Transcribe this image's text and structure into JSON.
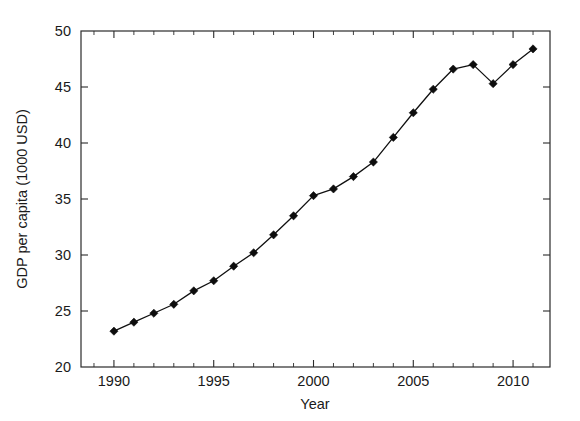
{
  "chart_data": {
    "type": "line",
    "title": "",
    "xlabel": "Year",
    "ylabel": "GDP per capita (1000 USD)",
    "xlim": [
      1988.35,
      2011.85
    ],
    "ylim": [
      20,
      50
    ],
    "xticks": [
      1990,
      1995,
      2000,
      2005,
      2010
    ],
    "xtick_labels": [
      "1990",
      "1995",
      "2000",
      "2005",
      "2010"
    ],
    "xtick_minor_step": 1,
    "yticks": [
      20,
      25,
      30,
      35,
      40,
      45,
      50
    ],
    "ytick_labels": [
      "20",
      "25",
      "30",
      "35",
      "40",
      "45",
      "50"
    ],
    "grid": false,
    "legend": null,
    "frame": "box",
    "tick_direction": "in",
    "marker": "diamond",
    "line_color": "#101010",
    "marker_color": "#0d0d0d",
    "background_color": "#ffffff",
    "x": [
      1990,
      1991,
      1992,
      1993,
      1994,
      1995,
      1996,
      1997,
      1998,
      1999,
      2000,
      2001,
      2002,
      2003,
      2004,
      2005,
      2006,
      2007,
      2008,
      2009,
      2010,
      2011
    ],
    "values": [
      23.2,
      24.0,
      24.8,
      25.6,
      26.8,
      27.7,
      29.0,
      30.2,
      31.8,
      33.5,
      35.3,
      35.9,
      37.0,
      38.3,
      40.5,
      42.7,
      44.8,
      46.6,
      47.0,
      45.3,
      47.0,
      48.4
    ],
    "series": [
      {
        "name": "GDP per capita",
        "values": [
          23.2,
          24.0,
          24.8,
          25.6,
          26.8,
          27.7,
          29.0,
          30.2,
          31.8,
          33.5,
          35.3,
          35.9,
          37.0,
          38.3,
          40.5,
          42.7,
          44.8,
          46.6,
          47.0,
          45.3,
          47.0,
          48.4
        ]
      }
    ]
  }
}
